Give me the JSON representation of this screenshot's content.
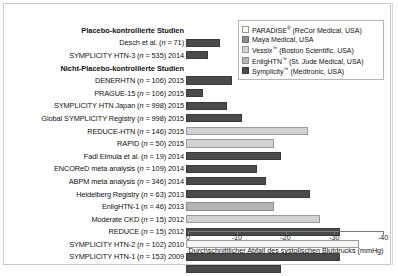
{
  "chart_data": {
    "type": "bar",
    "orientation": "horizontal",
    "title": "",
    "xlabel": "Durchschnittlicher Abfall des systolischen Blutdrucks (mmHg)",
    "ylabel": "",
    "xlim": [
      0,
      -40
    ],
    "xticks": [
      0,
      -10,
      -20,
      -30,
      -40
    ],
    "xticklabels": [
      "0",
      "-10",
      "-20",
      "-30",
      "-40"
    ],
    "grid": false,
    "legend_position": "top-right",
    "legend": [
      {
        "label": "PARADISE® (ReCor Medical, USA)",
        "color": "#f6f6f4",
        "key": "paradise"
      },
      {
        "label": "Maya Medical, USA",
        "color": "#8e8e8e",
        "key": "maya"
      },
      {
        "label": "Vessix™ (Boston Scientific, USA)",
        "color": "#d2d2d2",
        "key": "vessix"
      },
      {
        "label": "EnligHTN™ (St. Jude Medical, USA)",
        "color": "#b6b6b6",
        "key": "enlighn"
      },
      {
        "label": "Symplicity™ (Medtronic, USA)",
        "color": "#4a4a4a",
        "key": "symplicity"
      }
    ],
    "sections": [
      {
        "label": "Placebo-kontrollierte Studien"
      },
      {
        "label": "Nicht-Placebo-kontrollierte Studien"
      }
    ],
    "rows": [
      {
        "type": "section",
        "label": "Placebo-kontrollierte Studien"
      },
      {
        "type": "bar",
        "label": "Desch et al. (n = 71)",
        "value": -7.0,
        "device": "symplicity"
      },
      {
        "type": "bar",
        "label": "SYMPLICITY HTN-3 (n = 535) 2014",
        "value": -4.5,
        "device": "symplicity"
      },
      {
        "type": "section",
        "label": "Nicht-Placebo-kontrollierte Studien"
      },
      {
        "type": "bar",
        "label": "DENERHTN (n = 106) 2015",
        "value": -9.5,
        "device": "symplicity"
      },
      {
        "type": "bar",
        "label": "PRAGUE-15 (n = 106) 2015",
        "value": -3.5,
        "device": "symplicity"
      },
      {
        "type": "bar",
        "label": "SYMPLICITY HTN Japan (n = 998) 2015",
        "value": -8.5,
        "device": "symplicity"
      },
      {
        "type": "bar",
        "label": "Global SYMPLICITY Registry (n = 998) 2015",
        "value": -11.5,
        "device": "symplicity"
      },
      {
        "type": "bar",
        "label": "REDUCE-HTN (n = 146) 2015",
        "value": -25.0,
        "device": "vessix"
      },
      {
        "type": "bar",
        "label": "RAPID (n = 50) 2015",
        "value": -18.0,
        "device": "vessix"
      },
      {
        "type": "bar",
        "label": "Fadl Elmula et al. (n = 19) 2014",
        "value": -19.5,
        "device": "symplicity"
      },
      {
        "type": "bar",
        "label": "ENCOReD meta analysis (n = 109) 2014",
        "value": -14.5,
        "device": "symplicity"
      },
      {
        "type": "bar",
        "label": "ABPM meta analysis (n = 346) 2014",
        "value": -16.5,
        "device": "symplicity"
      },
      {
        "type": "bar",
        "label": "Heidelberg Registry (n = 63) 2013",
        "value": -25.5,
        "device": "symplicity"
      },
      {
        "type": "bar",
        "label": "EnligHTN-1 (n = 46) 2013",
        "value": -18.0,
        "device": "enlighn"
      },
      {
        "type": "bar",
        "label": "Moderate CKD (n = 15) 2012",
        "value": -27.5,
        "device": "vessix"
      },
      {
        "type": "bar",
        "label": "REDUCE (n = 15) 2012",
        "value": -31.5,
        "device": "symplicity"
      },
      {
        "type": "bar",
        "label": "SYMPLICITY HTN-2 (n = 102) 2010",
        "value": -35.5,
        "device": "paradise"
      },
      {
        "type": "bar",
        "label": "SYMPLICITY HTN-1 (n = 153) 2009",
        "value": -31.5,
        "device": "symplicity"
      },
      {
        "type": "bar",
        "label": "",
        "value": -19.5,
        "device": "symplicity"
      }
    ]
  }
}
